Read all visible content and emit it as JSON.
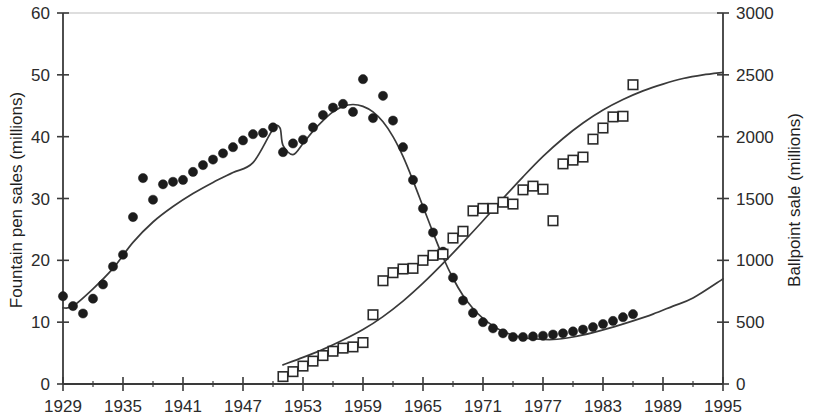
{
  "chart_data": {
    "type": "scatter",
    "title": "",
    "xlabel": "",
    "ylabel": "Fountain pen sales (millions)",
    "y2label": "Ballpoint sale (millions)",
    "xlim": [
      1929,
      1995
    ],
    "ylim": [
      0,
      60
    ],
    "y2lim": [
      0,
      3000
    ],
    "grid": false,
    "legend": "none",
    "x_major_ticks": [
      1929,
      1935,
      1941,
      1947,
      1953,
      1959,
      1965,
      1971,
      1977,
      1983,
      1989,
      1995
    ],
    "x_minor_ticks": [
      1932,
      1938,
      1944,
      1950,
      1956,
      1962,
      1968,
      1974,
      1980,
      1986,
      1992
    ],
    "x_tick_labels": [
      "1929",
      "1935",
      "1941",
      "1947",
      "1953",
      "1959",
      "1965",
      "1971",
      "1977",
      "1983",
      "1989",
      "1995"
    ],
    "y_ticks": [
      0,
      10,
      20,
      30,
      40,
      50,
      60
    ],
    "y_tick_labels": [
      "0",
      "10",
      "20",
      "30",
      "40",
      "50",
      "60"
    ],
    "y2_ticks": [
      0,
      500,
      1000,
      1500,
      2000,
      2500,
      3000
    ],
    "y2_tick_labels": [
      "0",
      "500",
      "1000",
      "1500",
      "2000",
      "2500",
      "3000"
    ],
    "series": [
      {
        "name": "Fountain pen sales",
        "axis": "left",
        "marker": "filled-circle",
        "x": [
          1929,
          1930,
          1931,
          1932,
          1933,
          1934,
          1935,
          1936,
          1937,
          1938,
          1939,
          1940,
          1941,
          1942,
          1943,
          1944,
          1945,
          1946,
          1947,
          1948,
          1949,
          1950,
          1951,
          1952,
          1953,
          1954,
          1955,
          1956,
          1957,
          1958,
          1959,
          1960,
          1961,
          1962,
          1963,
          1964,
          1965,
          1966,
          1967,
          1968,
          1969,
          1970,
          1971,
          1972,
          1973,
          1974,
          1975,
          1976,
          1977,
          1978,
          1979,
          1980,
          1981,
          1982,
          1983,
          1984,
          1985,
          1986
        ],
        "values": [
          14.2,
          12.6,
          11.4,
          13.8,
          16.1,
          19.0,
          20.9,
          27.0,
          33.3,
          29.8,
          32.3,
          32.7,
          33.0,
          34.3,
          35.4,
          36.3,
          37.3,
          38.3,
          39.4,
          40.4,
          40.6,
          41.5,
          37.5,
          38.9,
          39.5,
          41.5,
          43.5,
          44.7,
          45.3,
          44.0,
          49.3,
          43.0,
          46.6,
          42.6,
          38.3,
          33.0,
          28.4,
          24.5,
          21.4,
          17.2,
          13.5,
          11.5,
          10.0,
          9.0,
          8.2,
          7.6,
          7.6,
          7.7,
          7.8,
          8.0,
          8.2,
          8.5,
          8.8,
          9.2,
          9.7,
          10.2,
          10.8,
          11.3
        ]
      },
      {
        "name": "Ballpoint sales",
        "axis": "right",
        "marker": "open-square",
        "x": [
          1951,
          1952,
          1953,
          1954,
          1955,
          1956,
          1957,
          1958,
          1959,
          1960,
          1961,
          1962,
          1963,
          1964,
          1965,
          1966,
          1967,
          1968,
          1969,
          1970,
          1971,
          1972,
          1973,
          1974,
          1975,
          1976,
          1977,
          1978,
          1979,
          1980,
          1981,
          1982,
          1983,
          1984,
          1985,
          1986
        ],
        "values": [
          60,
          100,
          145,
          185,
          230,
          265,
          290,
          300,
          335,
          560,
          835,
          900,
          930,
          935,
          1000,
          1040,
          1050,
          1180,
          1235,
          1400,
          1420,
          1420,
          1470,
          1455,
          1570,
          1600,
          1575,
          1320,
          1780,
          1810,
          1835,
          1980,
          2070,
          2160,
          2165,
          2420
        ]
      }
    ],
    "fit_curves": [
      {
        "name": "Fountain pen trend",
        "axis": "left",
        "x": [
          1929,
          1930,
          1932,
          1934,
          1936,
          1938,
          1940,
          1942,
          1944,
          1946,
          1948,
          1950,
          1950.7,
          1951,
          1952,
          1953,
          1954,
          1955,
          1956,
          1957,
          1958,
          1959,
          1960,
          1961,
          1962,
          1963,
          1964,
          1965,
          1966,
          1967,
          1968,
          1969,
          1970,
          1971,
          1972,
          1973,
          1974,
          1975,
          1976,
          1978,
          1980,
          1982,
          1984,
          1986,
          1988,
          1990,
          1992,
          1995
        ],
        "values": [
          12.3,
          12.6,
          15.4,
          18.7,
          22.9,
          26.2,
          28.7,
          30.8,
          32.6,
          34.2,
          35.8,
          41.2,
          41.4,
          38.6,
          37.1,
          38.9,
          40.9,
          42.6,
          44.0,
          44.9,
          45.2,
          44.9,
          44.0,
          42.4,
          40.0,
          36.8,
          32.9,
          28.7,
          24.5,
          20.5,
          17.1,
          14.3,
          12.2,
          10.6,
          9.4,
          8.5,
          7.9,
          7.5,
          7.3,
          7.2,
          7.6,
          8.3,
          9.2,
          10.2,
          11.3,
          12.6,
          13.9,
          17.0
        ]
      },
      {
        "name": "Ballpoint trend",
        "axis": "right",
        "x": [
          1951,
          1953,
          1955,
          1957,
          1959,
          1961,
          1963,
          1965,
          1967,
          1969,
          1971,
          1973,
          1975,
          1977,
          1979,
          1981,
          1983,
          1985,
          1987,
          1989,
          1991,
          1993,
          1995
        ],
        "values": [
          155,
          215,
          280,
          355,
          440,
          545,
          670,
          815,
          975,
          1145,
          1320,
          1500,
          1675,
          1840,
          1985,
          2110,
          2215,
          2300,
          2370,
          2425,
          2470,
          2500,
          2520
        ]
      }
    ]
  },
  "axes": {
    "left_title": "Fountain pen sales (millions)",
    "right_title": "Ballpoint sale (millions)"
  }
}
